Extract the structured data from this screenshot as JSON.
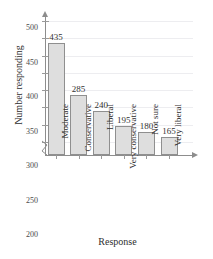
{
  "chart_data": {
    "type": "bar",
    "title": "",
    "xlabel": "Response",
    "ylabel": "Number responding",
    "categories": [
      "Moderate",
      "Conservative",
      "Liberal",
      "Very conservative",
      "Not sure",
      "Very liberal"
    ],
    "values": [
      435,
      285,
      240,
      195,
      180,
      165
    ],
    "data_labels": [
      "435",
      "285",
      "240",
      "195",
      "180",
      "165"
    ],
    "ylim": [
      150,
      500
    ],
    "yticks": [
      150,
      200,
      250,
      300,
      350,
      400,
      450,
      500
    ],
    "ytick_labels": [
      "150",
      "200",
      "250",
      "300",
      "350",
      "400",
      "450",
      "500"
    ],
    "axis_break": true,
    "grid": true,
    "grid_axis": "y",
    "legend": false,
    "bar_color": "#dedede",
    "bar_edge_color": "#8f8f8f",
    "axis_color": "#8d8d8d",
    "grid_color": "#ededf0",
    "text_color": "#2e2e2e"
  },
  "axes": {
    "y_title": "Number responding",
    "x_title": "Response"
  },
  "title_fragment": ""
}
